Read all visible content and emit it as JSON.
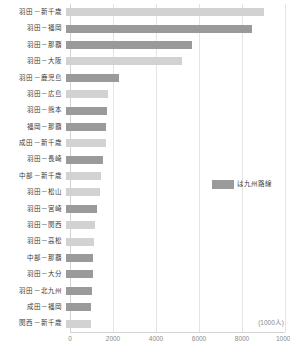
{
  "chart_data": {
    "type": "bar",
    "orientation": "horizontal",
    "title": "",
    "subtitle": "",
    "xlabel": "",
    "ylabel": "",
    "unit_label": "(1000人)",
    "xlim": [
      0,
      10000
    ],
    "xticks": [
      0,
      2000,
      4000,
      6000,
      8000,
      10000
    ],
    "xtick_labels": [
      "0",
      "2000",
      "4000",
      "6000",
      "8000",
      "10000"
    ],
    "grid": true,
    "legend_position": "center-right",
    "legend": [
      {
        "label": "は九州路線",
        "color": "#9a9a9a"
      }
    ],
    "colors": {
      "kyushu": "#9a9a9a",
      "other": "#d2d2d2",
      "gridline": "#e4e4e4",
      "axis": "#d2d2d2",
      "label_text": "#3a3a3a",
      "tick_text": "#8a8a8a"
    },
    "categories": [
      "羽田－新千歳",
      "羽田－福岡",
      "羽田－那覇",
      "羽田－大阪",
      "羽田－鹿児島",
      "羽田－広島",
      "羽田－熊本",
      "福岡－那覇",
      "成田－新千歳",
      "羽田－長崎",
      "中部－新千歳",
      "羽田－松山",
      "羽田－宮崎",
      "羽田－関西",
      "羽田－高松",
      "中部－那覇",
      "羽田－大分",
      "羽田－北九州",
      "成田－福岡",
      "関西－新千歳"
    ],
    "values": [
      9200,
      8650,
      5850,
      5400,
      2450,
      1950,
      1900,
      1880,
      1860,
      1700,
      1620,
      1560,
      1420,
      1330,
      1320,
      1270,
      1250,
      1230,
      1180,
      1150
    ],
    "series_flags": [
      "other",
      "kyushu",
      "kyushu",
      "other",
      "kyushu",
      "other",
      "kyushu",
      "kyushu",
      "other",
      "kyushu",
      "other",
      "other",
      "kyushu",
      "other",
      "other",
      "kyushu",
      "kyushu",
      "kyushu",
      "kyushu",
      "other"
    ]
  }
}
